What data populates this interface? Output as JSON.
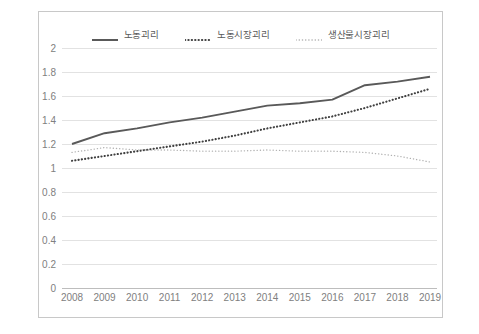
{
  "chart_data": {
    "type": "line",
    "title": "",
    "xlabel": "",
    "ylabel": "",
    "categories": [
      "2008",
      "2009",
      "2010",
      "2011",
      "2012",
      "2013",
      "2014",
      "2015",
      "2016",
      "2017",
      "2018",
      "2019"
    ],
    "ylim": [
      0,
      2
    ],
    "ytick_values": [
      0,
      0.2,
      0.4,
      0.6,
      0.8,
      1,
      1.2,
      1.4,
      1.6,
      1.8,
      2
    ],
    "ytick_labels": [
      "0",
      "0.2",
      "0.4",
      "0.6",
      "0.8",
      "1",
      "1.2",
      "1.4",
      "1.6",
      "1.8",
      "2"
    ],
    "grid": true,
    "grid_axis": "y",
    "legend_position": "top-center",
    "series": [
      {
        "name": "노동괴리",
        "style": "solid",
        "color": "#595959",
        "values": [
          1.2,
          1.29,
          1.33,
          1.38,
          1.42,
          1.47,
          1.52,
          1.54,
          1.57,
          1.69,
          1.72,
          1.76
        ]
      },
      {
        "name": "노동시장괴리",
        "style": "dotted-bold",
        "color": "#404040",
        "values": [
          1.06,
          1.1,
          1.14,
          1.18,
          1.22,
          1.27,
          1.33,
          1.38,
          1.43,
          1.5,
          1.58,
          1.66
        ]
      },
      {
        "name": "생산물시장괴리",
        "style": "dotted-light",
        "color": "#b0b0b0",
        "values": [
          1.13,
          1.17,
          1.15,
          1.15,
          1.14,
          1.14,
          1.15,
          1.14,
          1.14,
          1.13,
          1.1,
          1.05
        ]
      }
    ]
  },
  "axes": {
    "y_axis_name": "value-axis",
    "x_axis_name": "year-axis"
  }
}
